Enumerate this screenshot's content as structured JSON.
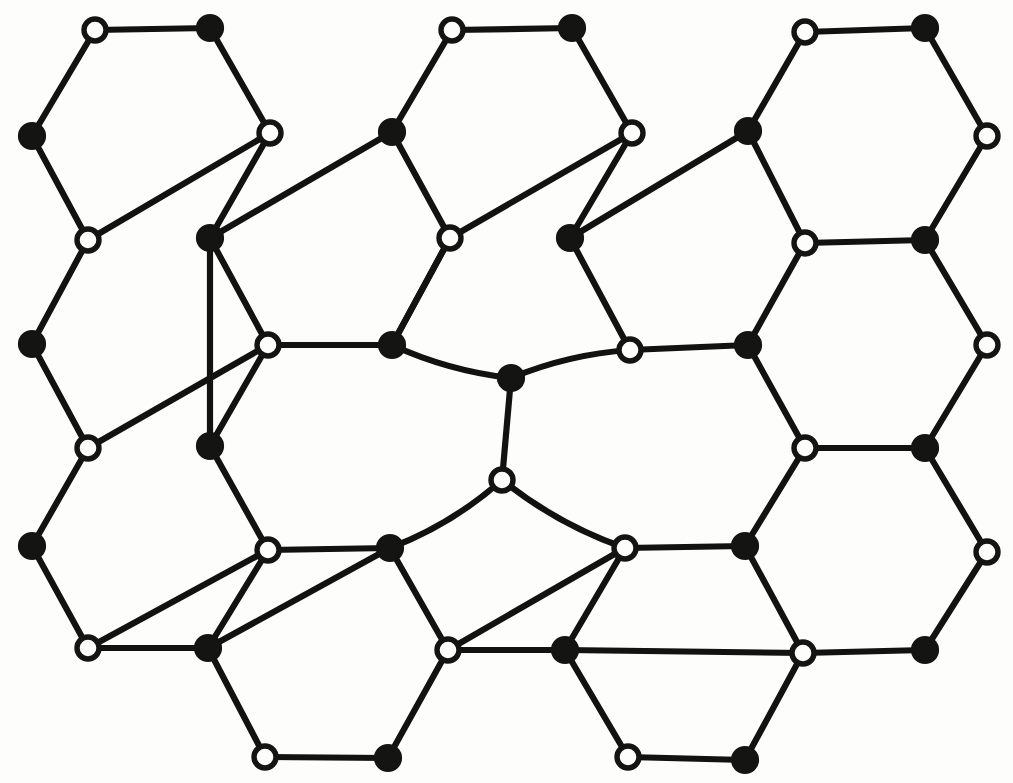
{
  "figure": {
    "title": "Honeycomb lattice with central Stone-Wales type defect",
    "background_color": "#fdfdfc",
    "bond_color": "#121210",
    "filled_node_color": "#141412",
    "open_node_fill": "#fdfdfc",
    "open_node_stroke": "#141412",
    "bond_width_px": 6.2,
    "filled_node_radius_px": 13,
    "open_node_radius_px": 11,
    "canvas": {
      "width": 1013,
      "height": 783
    }
  },
  "legend": {
    "filled_label": "sublattice A (filled circle)",
    "open_label": "sublattice B (open circle)"
  },
  "chart_data": {
    "type": "scatter",
    "xlabel": "",
    "ylabel": "",
    "xlim": [
      0,
      1013
    ],
    "ylim": [
      0,
      783
    ],
    "grid": false,
    "legend_position": "none",
    "node_counts": {
      "filled": 26,
      "open": 25,
      "total": 51
    },
    "bond_count": 66,
    "nodes": [
      {
        "id": "n0",
        "x": 95,
        "y": 30,
        "type": "open"
      },
      {
        "id": "n1",
        "x": 210,
        "y": 28,
        "type": "filled"
      },
      {
        "id": "n2",
        "x": 452,
        "y": 30,
        "type": "open"
      },
      {
        "id": "n3",
        "x": 572,
        "y": 28,
        "type": "filled"
      },
      {
        "id": "n4",
        "x": 805,
        "y": 32,
        "type": "open"
      },
      {
        "id": "n5",
        "x": 925,
        "y": 28,
        "type": "filled"
      },
      {
        "id": "n6",
        "x": 32,
        "y": 136,
        "type": "filled"
      },
      {
        "id": "n7",
        "x": 270,
        "y": 133,
        "type": "open"
      },
      {
        "id": "n8",
        "x": 392,
        "y": 132,
        "type": "filled"
      },
      {
        "id": "n9",
        "x": 632,
        "y": 133,
        "type": "open"
      },
      {
        "id": "n10",
        "x": 748,
        "y": 131,
        "type": "filled"
      },
      {
        "id": "n11",
        "x": 987,
        "y": 136,
        "type": "open"
      },
      {
        "id": "n12",
        "x": 88,
        "y": 240,
        "type": "open"
      },
      {
        "id": "n13",
        "x": 210,
        "y": 238,
        "type": "filled"
      },
      {
        "id": "n14",
        "x": 450,
        "y": 238,
        "type": "open"
      },
      {
        "id": "n15",
        "x": 570,
        "y": 238,
        "type": "filled"
      },
      {
        "id": "n16",
        "x": 805,
        "y": 243,
        "type": "open"
      },
      {
        "id": "n17",
        "x": 925,
        "y": 240,
        "type": "filled"
      },
      {
        "id": "n18",
        "x": 32,
        "y": 344,
        "type": "filled"
      },
      {
        "id": "n19",
        "x": 268,
        "y": 345,
        "type": "open"
      },
      {
        "id": "n20",
        "x": 392,
        "y": 345,
        "type": "filled"
      },
      {
        "id": "n21",
        "x": 630,
        "y": 350,
        "type": "open"
      },
      {
        "id": "n22",
        "x": 748,
        "y": 345,
        "type": "filled"
      },
      {
        "id": "n23",
        "x": 987,
        "y": 345,
        "type": "open"
      },
      {
        "id": "nc1",
        "x": 511,
        "y": 378,
        "type": "filled"
      },
      {
        "id": "nc2",
        "x": 502,
        "y": 480,
        "type": "open"
      },
      {
        "id": "n24",
        "x": 88,
        "y": 448,
        "type": "open"
      },
      {
        "id": "n25",
        "x": 210,
        "y": 446,
        "type": "filled"
      },
      {
        "id": "n26",
        "x": 805,
        "y": 448,
        "type": "open"
      },
      {
        "id": "n27",
        "x": 925,
        "y": 448,
        "type": "filled"
      },
      {
        "id": "n28",
        "x": 32,
        "y": 546,
        "type": "filled"
      },
      {
        "id": "n29",
        "x": 268,
        "y": 550,
        "type": "open"
      },
      {
        "id": "n30",
        "x": 390,
        "y": 548,
        "type": "filled"
      },
      {
        "id": "n31",
        "x": 625,
        "y": 548,
        "type": "open"
      },
      {
        "id": "n32",
        "x": 745,
        "y": 546,
        "type": "filled"
      },
      {
        "id": "n33",
        "x": 987,
        "y": 552,
        "type": "open"
      },
      {
        "id": "n34",
        "x": 88,
        "y": 648,
        "type": "open"
      },
      {
        "id": "n35",
        "x": 208,
        "y": 648,
        "type": "filled"
      },
      {
        "id": "n36",
        "x": 448,
        "y": 650,
        "type": "open"
      },
      {
        "id": "n37",
        "x": 565,
        "y": 650,
        "type": "filled"
      },
      {
        "id": "n38",
        "x": 803,
        "y": 653,
        "type": "open"
      },
      {
        "id": "n39",
        "x": 925,
        "y": 650,
        "type": "filled"
      },
      {
        "id": "n40",
        "x": 265,
        "y": 757,
        "type": "open"
      },
      {
        "id": "n41",
        "x": 388,
        "y": 758,
        "type": "filled"
      },
      {
        "id": "n42",
        "x": 628,
        "y": 757,
        "type": "open"
      },
      {
        "id": "n43",
        "x": 745,
        "y": 760,
        "type": "filled"
      }
    ],
    "bonds": [
      [
        "n0",
        "n1"
      ],
      [
        "n0",
        "n6"
      ],
      [
        "n1",
        "n7"
      ],
      [
        "n2",
        "n3"
      ],
      [
        "n2",
        "n8"
      ],
      [
        "n3",
        "n9"
      ],
      [
        "n4",
        "n5"
      ],
      [
        "n4",
        "n10"
      ],
      [
        "n5",
        "n11"
      ],
      [
        "n6",
        "n12"
      ],
      [
        "n7",
        "n12"
      ],
      [
        "n7",
        "n13"
      ],
      [
        "n8",
        "n13"
      ],
      [
        "n8",
        "n14"
      ],
      [
        "n9",
        "n14"
      ],
      [
        "n9",
        "n15"
      ],
      [
        "n10",
        "n15"
      ],
      [
        "n10",
        "n16"
      ],
      [
        "n11",
        "n17"
      ],
      [
        "n16",
        "n17"
      ],
      [
        "n12",
        "n18"
      ],
      [
        "n13",
        "n19"
      ],
      [
        "n14",
        "n20"
      ],
      [
        "n15",
        "n21"
      ],
      [
        "n16",
        "n22"
      ],
      [
        "n17",
        "n23"
      ],
      [
        "n18",
        "n24"
      ],
      [
        "n19",
        "n24"
      ],
      [
        "n19",
        "n20"
      ],
      [
        "n19",
        "n25"
      ],
      [
        "n21",
        "n22"
      ],
      [
        "n22",
        "n26"
      ],
      [
        "n23",
        "n27"
      ],
      [
        "n26",
        "n27"
      ],
      [
        "n20",
        "nc1"
      ],
      [
        "nc1",
        "n21"
      ],
      [
        "nc1",
        "nc2"
      ],
      [
        "nc2",
        "n30"
      ],
      [
        "nc2",
        "n31"
      ],
      [
        "n24",
        "n28"
      ],
      [
        "n25",
        "n29"
      ],
      [
        "n26",
        "n32"
      ],
      [
        "n27",
        "n33"
      ],
      [
        "n28",
        "n34"
      ],
      [
        "n29",
        "n34"
      ],
      [
        "n29",
        "n30"
      ],
      [
        "n29",
        "n35"
      ],
      [
        "n30",
        "n35"
      ],
      [
        "n31",
        "n32"
      ],
      [
        "n32",
        "n38"
      ],
      [
        "n33",
        "n39"
      ],
      [
        "n38",
        "n39"
      ],
      [
        "n30",
        "n36"
      ],
      [
        "n31",
        "n36"
      ],
      [
        "n31",
        "n37"
      ],
      [
        "n35",
        "n40"
      ],
      [
        "n36",
        "n41"
      ],
      [
        "n36",
        "n37"
      ],
      [
        "n37",
        "n42"
      ],
      [
        "n38",
        "n43"
      ],
      [
        "n40",
        "n41"
      ],
      [
        "n42",
        "n43"
      ],
      [
        "n37",
        "n38"
      ],
      [
        "n34",
        "n35"
      ],
      [
        "n25",
        "n13"
      ],
      [
        "n20",
        "n14"
      ]
    ]
  }
}
